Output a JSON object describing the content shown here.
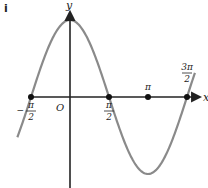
{
  "panel_label": "i",
  "chart_data": {
    "type": "line",
    "title": "",
    "xlabel": "x",
    "ylabel": "y",
    "origin_label": "O",
    "function": "y = cos x",
    "series": [
      {
        "name": "y = cos x",
        "x": [
          -1.5708,
          -0.7854,
          0,
          0.7854,
          1.5708,
          2.3562,
          3.1416,
          3.927,
          4.7124
        ],
        "values": [
          0,
          0.707,
          1,
          0.707,
          0,
          -0.707,
          -1,
          -0.707,
          0
        ]
      }
    ],
    "marked_points": [
      {
        "label_num": "π",
        "label_den": "2",
        "sign": "−",
        "x": -1.5708,
        "y": 0
      },
      {
        "label_num": "π",
        "label_den": "2",
        "sign": "",
        "x": 1.5708,
        "y": 0
      },
      {
        "label_num": "π",
        "label_den": "",
        "sign": "",
        "x": 3.1416,
        "y": 0
      },
      {
        "label_num": "3π",
        "label_den": "2",
        "sign": "",
        "x": 4.7124,
        "y": 0
      }
    ],
    "xlim": [
      -1.5708,
      4.9
    ],
    "ylim": [
      -1.05,
      1.15
    ],
    "grid": false,
    "legend": "none",
    "colors": {
      "curve": "#8a8a8a",
      "axes": "#222222",
      "points": "#111111"
    }
  }
}
